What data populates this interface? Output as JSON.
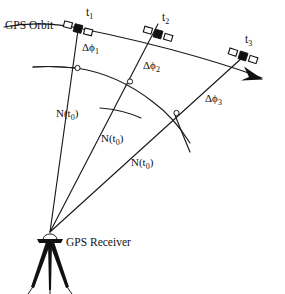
{
  "figure": {
    "title_text": "GPS Orbit",
    "receiver_text": "GPS Receiver",
    "satellites": [
      {
        "id": "t1",
        "label": "t",
        "sub": "1"
      },
      {
        "id": "t2",
        "label": "t",
        "sub": "2"
      },
      {
        "id": "t3",
        "label": "t",
        "sub": "3"
      }
    ],
    "phase_labels": [
      {
        "id": "dphi1",
        "prefix": "Δϕ",
        "sub": "1"
      },
      {
        "id": "dphi2",
        "prefix": "Δϕ",
        "sub": "2"
      },
      {
        "id": "dphi3",
        "prefix": "Δϕ",
        "sub": "3"
      }
    ],
    "range_labels": [
      {
        "id": "n1",
        "prefix": "N(t",
        "sub": "0",
        "suffix": ")"
      },
      {
        "id": "n2",
        "prefix": "N(t",
        "sub": "0",
        "suffix": ")"
      },
      {
        "id": "n3",
        "prefix": "N(t",
        "sub": "0",
        "suffix": ")"
      }
    ],
    "colors": {
      "ink": "#111111",
      "background": "#ffffff"
    }
  }
}
